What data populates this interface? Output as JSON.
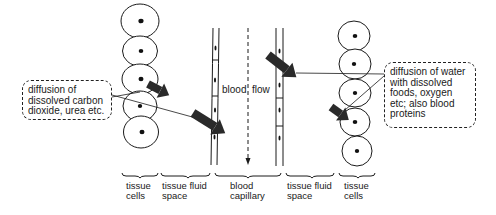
{
  "diagram": {
    "title": "",
    "callouts": {
      "left": "diffusion of\ndissolved carbon\ndioxide, urea etc.",
      "right": "diffusion of water\nwith dissolved\nfoods, oxygen\netc; also blood\nproteins"
    },
    "flow_label_a": "blood",
    "flow_label_b": "flow",
    "regions": [
      {
        "id": "tissue-cells-left",
        "label": "tissue\ncells"
      },
      {
        "id": "tissue-fluid-left",
        "label": "tissue fluid\nspace"
      },
      {
        "id": "blood-capillary",
        "label": "blood\ncapillary"
      },
      {
        "id": "tissue-fluid-right",
        "label": "tissue fluid\nspace"
      },
      {
        "id": "tissue-cells-right",
        "label": "tissue\ncells"
      }
    ],
    "colors": {
      "ink": "#1a1a1a",
      "arrow": "#2a2a2a",
      "background": "#ffffff"
    }
  }
}
